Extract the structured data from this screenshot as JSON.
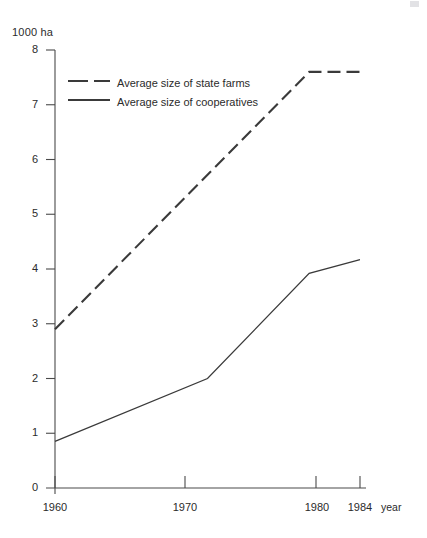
{
  "figure": {
    "unit_label": "1000 ha",
    "xaxis_title": "year"
  },
  "legend": {
    "items": [
      {
        "label": "Average size of state farms",
        "style": "dashed",
        "color": "#3a3a3a",
        "icon": "dashed-line-swatch-icon"
      },
      {
        "label": "Average size of cooperatives",
        "style": "solid",
        "color": "#3a3a3a",
        "icon": "solid-line-swatch-icon"
      }
    ]
  },
  "axes": {
    "y_ticks": [
      "8",
      "7",
      "6",
      "5",
      "4",
      "3",
      "2",
      "1",
      "0"
    ],
    "x_ticks": [
      "1960",
      "1970",
      "1980",
      "1984"
    ]
  },
  "chart_data": {
    "type": "line",
    "title": "",
    "xlabel": "year",
    "ylabel": "1000 ha",
    "xlim": [
      1960,
      1984
    ],
    "ylim": [
      0,
      8
    ],
    "grid": false,
    "legend_position": "top-left-inside",
    "x_tick_values": [
      1960,
      1970,
      1980,
      1984
    ],
    "y_tick_values": [
      0,
      1,
      2,
      3,
      4,
      5,
      6,
      7,
      8
    ],
    "series": [
      {
        "name": "Average size of state farms",
        "linestyle": "dashed",
        "color": "#3a3a3a",
        "x": [
          1960,
          1980,
          1984
        ],
        "values": [
          2.9,
          7.6,
          7.6
        ]
      },
      {
        "name": "Average size of cooperatives",
        "linestyle": "solid",
        "color": "#3a3a3a",
        "x": [
          1960,
          1972,
          1980,
          1984
        ],
        "values": [
          0.85,
          2.0,
          3.92,
          4.17
        ]
      }
    ]
  }
}
